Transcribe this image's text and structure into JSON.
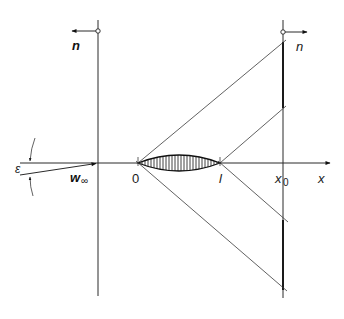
{
  "diagram": {
    "title": "",
    "labels": {
      "normal_left": "n",
      "normal_right": "n",
      "angle": "ε",
      "freestream_w": "w",
      "freestream_sub": "∞",
      "origin": "0",
      "chord_end": "l",
      "station": "x",
      "station_sub": "0",
      "axis_x": "x"
    },
    "geometry": {
      "x_axis_y": 163,
      "airfoil_leading_edge_x": 138,
      "airfoil_trailing_edge_x": 220,
      "left_vertical_x": 98,
      "right_vertical_x": 283,
      "freestream_angle_label": "epsilon"
    },
    "colors": {
      "line": "#2a2a2a",
      "background": "#ffffff"
    }
  }
}
